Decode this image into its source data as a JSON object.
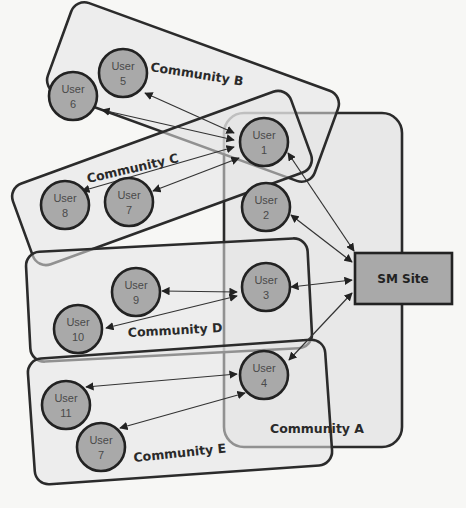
{
  "diagram": {
    "site": {
      "label": "SM Site"
    },
    "communities": {
      "A": {
        "label": "Community A"
      },
      "B": {
        "label": "Community B"
      },
      "C": {
        "label": "Community C"
      },
      "D": {
        "label": "Community D"
      },
      "E": {
        "label": "Community E"
      }
    },
    "users": [
      {
        "id": "u1",
        "line1": "User",
        "line2": "1",
        "community": "A"
      },
      {
        "id": "u2",
        "line1": "User",
        "line2": "2",
        "community": "A"
      },
      {
        "id": "u3",
        "line1": "User",
        "line2": "3",
        "community": "A"
      },
      {
        "id": "u4",
        "line1": "User",
        "line2": "4",
        "community": "A"
      },
      {
        "id": "u5",
        "line1": "User",
        "line2": "5",
        "community": "B"
      },
      {
        "id": "u6",
        "line1": "User",
        "line2": "6",
        "community": "B"
      },
      {
        "id": "u7c",
        "line1": "User",
        "line2": "7",
        "community": "C"
      },
      {
        "id": "u8",
        "line1": "User",
        "line2": "8",
        "community": "C"
      },
      {
        "id": "u9",
        "line1": "User",
        "line2": "9",
        "community": "D"
      },
      {
        "id": "u10",
        "line1": "User",
        "line2": "10",
        "community": "D"
      },
      {
        "id": "u11",
        "line1": "User",
        "line2": "11",
        "community": "E"
      },
      {
        "id": "u7e",
        "line1": "User",
        "line2": "7",
        "community": "E"
      }
    ],
    "connections": [
      [
        "User 1",
        "SM Site"
      ],
      [
        "User 2",
        "SM Site"
      ],
      [
        "User 3",
        "SM Site"
      ],
      [
        "User 4",
        "SM Site"
      ],
      [
        "User 1",
        "User 5"
      ],
      [
        "User 1",
        "User 6"
      ],
      [
        "User 1",
        "User 8"
      ],
      [
        "User 1",
        "User 7"
      ],
      [
        "User 3",
        "User 9"
      ],
      [
        "User 3",
        "User 10"
      ],
      [
        "User 4",
        "User 11"
      ],
      [
        "User 4",
        "User 7"
      ]
    ]
  }
}
